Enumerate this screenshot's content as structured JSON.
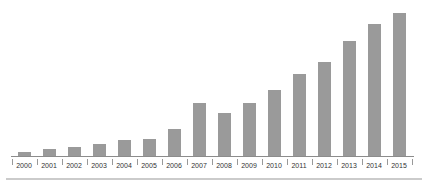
{
  "chart_data": {
    "type": "bar",
    "title": "",
    "xlabel": "",
    "ylabel": "",
    "categories": [
      "2000",
      "2001",
      "2002",
      "2003",
      "2004",
      "2005",
      "2006",
      "2007",
      "2008",
      "2009",
      "2010",
      "2011",
      "2012",
      "2013",
      "2014",
      "2015"
    ],
    "values": [
      4,
      7,
      9,
      12,
      16,
      17,
      27,
      53,
      43,
      53,
      66,
      82,
      94,
      115,
      132,
      143
    ],
    "value_unit": "relative height (no y-axis shown)",
    "ylim": [
      0,
      150
    ],
    "grid": false,
    "legend": null,
    "y_axis_visible": false,
    "x_tick_style": "boundary ticks between year labels"
  },
  "colors": {
    "background": "#ffffff",
    "bar": "#9a9a9a",
    "axis": "#8c8c8c",
    "tick": "#999999",
    "label": "#333333",
    "separator": "#cbcbcb"
  }
}
